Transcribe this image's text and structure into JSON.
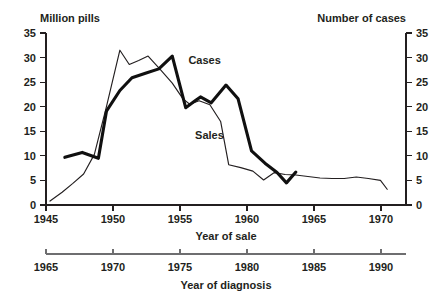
{
  "chart_data": {
    "type": "line",
    "title": "",
    "grid": false,
    "legend_position": "inline-annotation",
    "left_axis": {
      "label": "Million pills",
      "ticks": [
        0,
        5,
        10,
        15,
        20,
        25,
        30,
        35
      ],
      "ylim": [
        0,
        35
      ]
    },
    "right_axis": {
      "label": "Number of cases",
      "ticks": [
        0,
        5,
        10,
        15,
        20,
        25,
        30,
        35
      ],
      "ylim": [
        0,
        35
      ]
    },
    "x_axis_primary": {
      "label": "Year of sale",
      "ticks": [
        1945,
        1950,
        1955,
        1960,
        1965,
        1970
      ],
      "xlim": [
        1945,
        1971.8
      ]
    },
    "x_axis_secondary": {
      "label": "Year of diagnosis",
      "ticks": [
        1965,
        1970,
        1975,
        1980,
        1985,
        1990
      ],
      "xlim": [
        1965,
        1991.8
      ]
    },
    "series": [
      {
        "name": "Sales",
        "label": "Sales",
        "style": "thin",
        "axis": "left",
        "unit": "Million pills",
        "x": [
          1945.3,
          1946.2,
          1947.0,
          1947.8,
          1948.6,
          1949.5,
          1950.5,
          1951.2,
          1951.9,
          1952.6,
          1953.5,
          1954.4,
          1955.2,
          1955.7,
          1956.4,
          1957.2,
          1958.0,
          1958.6,
          1959.5,
          1960.4,
          1961.2,
          1962.0,
          1962.8,
          1963.6,
          1964.5,
          1965.4,
          1966.3,
          1967.2,
          1968.1,
          1969.0,
          1969.9,
          1970.4
        ],
        "y": [
          0.8,
          2.6,
          4.4,
          6.3,
          10.3,
          20.0,
          31.5,
          28.6,
          29.4,
          30.3,
          27.6,
          24.8,
          21.6,
          20.5,
          21.2,
          20.4,
          17.0,
          8.2,
          7.6,
          6.9,
          5.1,
          6.6,
          6.2,
          6.1,
          5.8,
          5.5,
          5.4,
          5.4,
          5.7,
          5.4,
          5.0,
          3.2
        ]
      },
      {
        "name": "Cases",
        "label": "Cases",
        "style": "thick",
        "axis": "right",
        "unit": "Number of cases",
        "x": [
          1946.4,
          1947.7,
          1948.9,
          1949.5,
          1950.5,
          1951.4,
          1952.4,
          1953.4,
          1954.4,
          1955.4,
          1956.1,
          1956.5,
          1957.3,
          1958.4,
          1959.3,
          1960.3,
          1961.3,
          1962.2,
          1962.9,
          1963.6
        ],
        "y": [
          9.7,
          10.7,
          9.5,
          19.1,
          23.3,
          25.9,
          26.8,
          27.7,
          30.3,
          19.8,
          21.2,
          22.0,
          20.8,
          24.4,
          21.6,
          11.0,
          8.5,
          6.6,
          4.5,
          6.7
        ]
      }
    ],
    "annotations": [
      {
        "text": "Cases",
        "x_year": 1955.6,
        "y_value": 28.6
      },
      {
        "text": "Sales",
        "x_year": 1956.1,
        "y_value": 13.4
      }
    ]
  },
  "axis_titles": {
    "left_header": "Million pills",
    "right_header": "Number of cases",
    "x_primary": "Year of sale",
    "x_secondary": "Year of diagnosis"
  },
  "tick_labels": {
    "y_left": [
      "35",
      "30",
      "25",
      "20",
      "15",
      "10",
      "5",
      "0"
    ],
    "y_right": [
      "35",
      "30",
      "25",
      "20",
      "15",
      "10",
      "5",
      "0"
    ],
    "x_primary": [
      "1945",
      "1950",
      "1955",
      "1960",
      "1965",
      "1970"
    ],
    "x_secondary": [
      "1965",
      "1970",
      "1975",
      "1980",
      "1985",
      "1990"
    ]
  },
  "colors": {
    "ink": "#231f20",
    "secondary_axis": "#6e6e70",
    "background": "#ffffff"
  }
}
